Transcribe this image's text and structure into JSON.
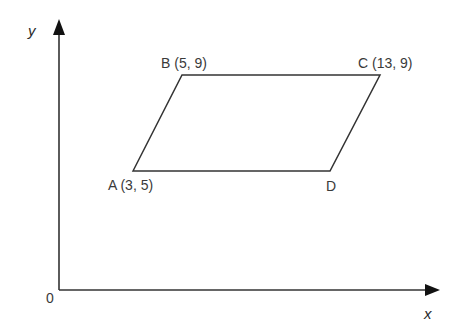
{
  "diagram": {
    "type": "coordinate-geometry",
    "shape": "parallelogram",
    "axes": {
      "x_label": "x",
      "y_label": "y",
      "origin_label": "0"
    },
    "vertices": [
      {
        "name": "A",
        "label": "A (3, 5)",
        "coords": [
          3,
          5
        ]
      },
      {
        "name": "B",
        "label": "B (5, 9)",
        "coords": [
          5,
          9
        ]
      },
      {
        "name": "C",
        "label": "C (13, 9)",
        "coords": [
          13,
          9
        ]
      },
      {
        "name": "D",
        "label": "D",
        "coords": null
      }
    ],
    "colors": {
      "line": "#333333",
      "text": "#3a3a3a",
      "background": "#ffffff"
    }
  }
}
